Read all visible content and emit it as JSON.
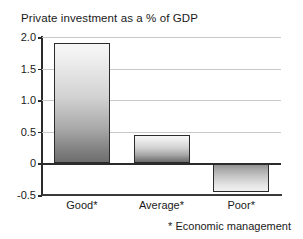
{
  "chart_data": {
    "type": "bar",
    "title": "Private investment as a % of GDP",
    "xlabel": "",
    "ylabel": "",
    "categories": [
      "Good*",
      "Average*",
      "Poor*"
    ],
    "values": [
      1.9,
      0.45,
      -0.45
    ],
    "series": [
      {
        "name": "Private investment as a % of GDP",
        "values": [
          1.9,
          0.45,
          -0.45
        ]
      }
    ],
    "ylim": [
      -0.5,
      2.0
    ],
    "yticks": [
      2.0,
      1.5,
      1.0,
      0.5,
      0,
      -0.5
    ],
    "ytick_labels": [
      "2.0",
      "1.5",
      "1.0",
      "0.5",
      "0",
      "-0.5"
    ],
    "grid": true,
    "legend": false,
    "legend_position": "none",
    "annotations": [
      "* Economic management"
    ],
    "zero_line": 0,
    "bar_style": "vertical-gradient-grey",
    "colors": {
      "bar_positive_top": "#f7f7f7",
      "bar_positive_bottom": "#6e6e6e",
      "bar_negative_top": "#8c8c8c",
      "bar_negative_bottom": "#f2f2f2",
      "bar_border": "#2b2b2b",
      "gridline": "#c9c9c9",
      "axis": "#2b2b2b",
      "text": "#1a1a1a",
      "background": "#ffffff"
    }
  },
  "footnote": {
    "text": "* Economic management"
  }
}
